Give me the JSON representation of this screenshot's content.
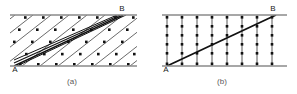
{
  "figure": {
    "background_color": "#ffffff",
    "ink_color": "#1f1f1f",
    "boundary_color": "#8a8a8a",
    "atom_color": "#111111",
    "panels": [
      {
        "id": "a",
        "caption": "(a)",
        "caption_x": 72,
        "caption_y": 84,
        "start_label": "A",
        "end_label": "B",
        "start_label_x": 15,
        "start_label_y": 72,
        "end_label_x": 122,
        "end_label_y": 11,
        "box": {
          "x": 10,
          "y": 15,
          "width": 127,
          "height": 51
        },
        "description": "inclined slip planes with atom rows",
        "slip_line_count": 11,
        "atom_columns": 8,
        "atom_rows": 5,
        "highlighted_band_lines": 3
      },
      {
        "id": "b",
        "caption": "(b)",
        "caption_x": 222,
        "caption_y": 84,
        "start_label": "A",
        "end_label": "B",
        "start_label_x": 165,
        "start_label_y": 72,
        "end_label_x": 273,
        "end_label_y": 11,
        "box": {
          "x": 162,
          "y": 15,
          "width": 125,
          "height": 51
        },
        "description": "vertical atom columns crossed by a single inclined dislocation line",
        "column_count": 8,
        "atoms_per_column": 6,
        "diagonal_lines": 1
      }
    ]
  }
}
